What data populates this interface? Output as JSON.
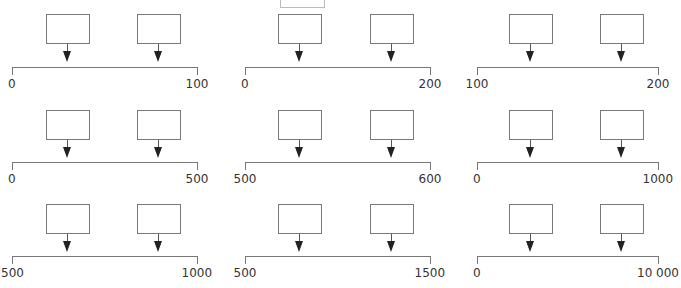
{
  "diagram": {
    "rows": 3,
    "columns": 3,
    "number_lines": [
      {
        "row": 0,
        "col": 0,
        "start": "0",
        "end": "100"
      },
      {
        "row": 0,
        "col": 1,
        "start": "0",
        "end": "200"
      },
      {
        "row": 0,
        "col": 2,
        "start": "100",
        "end": "200"
      },
      {
        "row": 1,
        "col": 0,
        "start": "0",
        "end": "500"
      },
      {
        "row": 1,
        "col": 1,
        "start": "500",
        "end": "600"
      },
      {
        "row": 1,
        "col": 2,
        "start": "0",
        "end": "1000"
      },
      {
        "row": 2,
        "col": 0,
        "start": "500",
        "end": "1000"
      },
      {
        "row": 2,
        "col": 1,
        "start": "500",
        "end": "1500"
      },
      {
        "row": 2,
        "col": 2,
        "start": "0",
        "end": "10 000"
      }
    ],
    "answer_boxes": [
      {
        "line": 0,
        "box1": "",
        "box2": ""
      },
      {
        "line": 1,
        "box1": "",
        "box2": ""
      },
      {
        "line": 2,
        "box1": "",
        "box2": ""
      },
      {
        "line": 3,
        "box1": "",
        "box2": ""
      },
      {
        "line": 4,
        "box1": "",
        "box2": ""
      },
      {
        "line": 5,
        "box1": "",
        "box2": ""
      },
      {
        "line": 6,
        "box1": "",
        "box2": ""
      },
      {
        "line": 7,
        "box1": "",
        "box2": ""
      },
      {
        "line": 8,
        "box1": "",
        "box2": ""
      }
    ],
    "colors": {
      "box_border": "#7a7a7a",
      "axis": "#777777",
      "arrow": "#222222",
      "label": "#333333"
    }
  }
}
